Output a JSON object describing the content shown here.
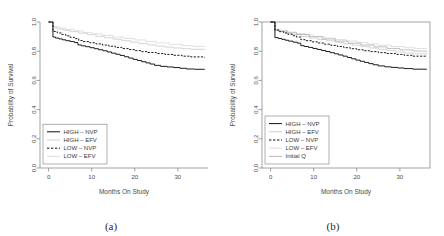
{
  "figure": {
    "panels": [
      {
        "id": "a",
        "caption": "(a)",
        "frame": "L-shaped",
        "legend": [
          {
            "label": "HIGH – NVP",
            "style": "solid",
            "color": "#111111"
          },
          {
            "label": "HIGH – EFV",
            "style": "solid",
            "color": "#c9c9c9"
          },
          {
            "label": "LOW – NVP",
            "style": "dashed",
            "color": "#111111"
          },
          {
            "label": "LOW – EFV",
            "style": "solid",
            "color": "#d8d8d8"
          }
        ]
      },
      {
        "id": "b",
        "caption": "(b)",
        "frame": "box",
        "legend": [
          {
            "label": "HIGH – NVP",
            "style": "solid",
            "color": "#111111"
          },
          {
            "label": "HIGH – EFV",
            "style": "solid",
            "color": "#c9c9c9"
          },
          {
            "label": "LOW – NVP",
            "style": "dashed",
            "color": "#111111"
          },
          {
            "label": "LOW – EFV",
            "style": "solid",
            "color": "#d8d8d8"
          },
          {
            "label": "Initial Q",
            "style": "solid",
            "color": "#b0b0b0"
          }
        ]
      }
    ]
  },
  "chart_data": [
    {
      "type": "line",
      "title": "",
      "panel": "(a)",
      "xlabel": "Months On Study",
      "ylabel": "Probability of Survival",
      "xlim": [
        -2,
        37
      ],
      "ylim": [
        0.0,
        1.0
      ],
      "xticks": [
        0,
        10,
        20,
        30
      ],
      "xticklabels": [
        "0",
        "10",
        "20",
        "30"
      ],
      "yticks": [
        0.0,
        0.2,
        0.4,
        0.6,
        0.8,
        1.0
      ],
      "yticklabels": [
        "0.0",
        "0.2",
        "0.4",
        "0.6",
        "0.8",
        "1.0"
      ],
      "grid": false,
      "legend_position": "lower-left",
      "step": "post",
      "series": [
        {
          "name": "HIGH – NVP",
          "style": "solid",
          "color": "#111111",
          "x": [
            0,
            1.0,
            1.6,
            2.4,
            3.2,
            4.0,
            5.0,
            6.0,
            6.8,
            7.6,
            8.6,
            9.6,
            10.6,
            11.6,
            12.6,
            13.6,
            14.6,
            15.6,
            16.6,
            17.6,
            18.6,
            19.6,
            20.6,
            21.6,
            22.6,
            23.6,
            24.6,
            26.0,
            27.5,
            29.0,
            30.5,
            32.0,
            34.0,
            36.2
          ],
          "y": [
            1.0,
            0.897,
            0.89,
            0.884,
            0.878,
            0.872,
            0.866,
            0.859,
            0.843,
            0.837,
            0.831,
            0.824,
            0.817,
            0.81,
            0.803,
            0.795,
            0.787,
            0.779,
            0.771,
            0.762,
            0.753,
            0.744,
            0.736,
            0.728,
            0.72,
            0.712,
            0.703,
            0.696,
            0.692,
            0.688,
            0.683,
            0.678,
            0.676,
            0.674
          ]
        },
        {
          "name": "HIGH – EFV",
          "style": "solid",
          "color": "#c9c9c9",
          "x": [
            0,
            1.0,
            2.0,
            3.5,
            5.0,
            7.0,
            9.0,
            11.0,
            13.0,
            15.0,
            17.0,
            19.0,
            21.0,
            23.0,
            25.0,
            27.0,
            29.0,
            31.0,
            33.0,
            36.2
          ],
          "y": [
            1.0,
            0.962,
            0.952,
            0.943,
            0.934,
            0.924,
            0.913,
            0.902,
            0.892,
            0.882,
            0.872,
            0.862,
            0.852,
            0.843,
            0.835,
            0.828,
            0.822,
            0.817,
            0.813,
            0.81
          ]
        },
        {
          "name": "LOW – NVP",
          "style": "dashed",
          "color": "#111111",
          "x": [
            0,
            1.0,
            2.0,
            3.0,
            4.0,
            5.0,
            6.0,
            7.0,
            8.0,
            9.5,
            11.0,
            12.5,
            14.0,
            15.5,
            17.0,
            18.5,
            20.0,
            21.5,
            23.0,
            25.0,
            27.0,
            29.0,
            31.0,
            33.0,
            36.2
          ],
          "y": [
            1.0,
            0.935,
            0.925,
            0.915,
            0.905,
            0.895,
            0.886,
            0.873,
            0.866,
            0.858,
            0.85,
            0.842,
            0.834,
            0.826,
            0.818,
            0.811,
            0.804,
            0.797,
            0.791,
            0.784,
            0.778,
            0.772,
            0.766,
            0.761,
            0.757
          ]
        },
        {
          "name": "LOW – EFV",
          "style": "solid",
          "color": "#d8d8d8",
          "x": [
            0,
            1.2,
            2.5,
            4.0,
            6.0,
            8.0,
            10.0,
            12.5,
            15.0,
            17.5,
            20.0,
            22.5,
            25.0,
            28.0,
            31.0,
            33.5,
            36.2
          ],
          "y": [
            1.0,
            0.968,
            0.958,
            0.949,
            0.939,
            0.929,
            0.919,
            0.908,
            0.897,
            0.887,
            0.877,
            0.867,
            0.857,
            0.847,
            0.838,
            0.832,
            0.828
          ]
        }
      ]
    },
    {
      "type": "line",
      "title": "",
      "panel": "(b)",
      "xlabel": "Months On Study",
      "ylabel": "Probability of Survival",
      "xlim": [
        -2,
        37
      ],
      "ylim": [
        0.0,
        1.0
      ],
      "xticks": [
        0,
        10,
        20,
        30
      ],
      "xticklabels": [
        "0",
        "10",
        "20",
        "30"
      ],
      "yticks": [
        0.0,
        0.2,
        0.4,
        0.6,
        0.8,
        1.0
      ],
      "yticklabels": [
        "0.0",
        "0.2",
        "0.4",
        "0.6",
        "0.8",
        "1.0"
      ],
      "grid": false,
      "legend_position": "lower-left",
      "step": "post",
      "series": [
        {
          "name": "HIGH – NVP",
          "style": "solid",
          "color": "#111111",
          "x": [
            0,
            1.0,
            1.8,
            2.6,
            3.4,
            4.2,
            5.2,
            6.2,
            7.0,
            7.8,
            8.8,
            9.8,
            10.8,
            11.8,
            12.8,
            13.8,
            14.8,
            15.8,
            16.8,
            17.8,
            18.8,
            19.8,
            20.8,
            21.8,
            22.8,
            23.8,
            25.0,
            26.5,
            28.0,
            29.5,
            31.0,
            33.0,
            36.2
          ],
          "y": [
            1.0,
            0.893,
            0.887,
            0.881,
            0.875,
            0.869,
            0.862,
            0.855,
            0.838,
            0.832,
            0.826,
            0.819,
            0.812,
            0.805,
            0.798,
            0.79,
            0.782,
            0.774,
            0.766,
            0.757,
            0.748,
            0.739,
            0.731,
            0.723,
            0.715,
            0.707,
            0.699,
            0.693,
            0.689,
            0.685,
            0.681,
            0.677,
            0.674
          ]
        },
        {
          "name": "HIGH – EFV",
          "style": "solid",
          "color": "#c9c9c9",
          "x": [
            0,
            1.0,
            2.0,
            3.5,
            5.0,
            7.0,
            9.0,
            11.0,
            13.0,
            15.0,
            17.0,
            19.0,
            21.0,
            23.0,
            25.0,
            27.0,
            29.0,
            31.0,
            33.0,
            36.2
          ],
          "y": [
            1.0,
            0.944,
            0.934,
            0.924,
            0.915,
            0.901,
            0.89,
            0.88,
            0.871,
            0.861,
            0.851,
            0.841,
            0.831,
            0.822,
            0.813,
            0.804,
            0.795,
            0.788,
            0.782,
            0.777
          ]
        },
        {
          "name": "LOW – NVP",
          "style": "dashed",
          "color": "#111111",
          "x": [
            0,
            1.0,
            2.0,
            3.0,
            4.0,
            5.0,
            6.0,
            7.0,
            8.0,
            9.5,
            11.0,
            12.5,
            14.0,
            15.5,
            17.0,
            18.5,
            20.0,
            21.5,
            23.0,
            25.0,
            27.0,
            29.0,
            31.0,
            33.0,
            36.2
          ],
          "y": [
            1.0,
            0.944,
            0.934,
            0.925,
            0.916,
            0.906,
            0.897,
            0.879,
            0.872,
            0.864,
            0.856,
            0.848,
            0.84,
            0.832,
            0.824,
            0.817,
            0.81,
            0.803,
            0.797,
            0.79,
            0.784,
            0.778,
            0.772,
            0.766,
            0.762
          ]
        },
        {
          "name": "LOW – EFV",
          "style": "solid",
          "color": "#d8d8d8",
          "x": [
            0,
            1.2,
            2.5,
            4.0,
            6.0,
            8.0,
            10.0,
            12.5,
            15.0,
            17.5,
            20.0,
            22.5,
            25.0,
            28.0,
            31.0,
            33.5,
            36.2
          ],
          "y": [
            1.0,
            0.95,
            0.94,
            0.931,
            0.921,
            0.911,
            0.901,
            0.89,
            0.88,
            0.87,
            0.86,
            0.85,
            0.841,
            0.832,
            0.824,
            0.818,
            0.814
          ]
        },
        {
          "name": "Initial Q",
          "style": "solid",
          "color": "#b0b0b0",
          "x": [
            0,
            1.0,
            2.0,
            4.0,
            6.0,
            9.0,
            12.0,
            15.0,
            18.0,
            21.0,
            24.0,
            27.0,
            30.0,
            33.0,
            36.2
          ],
          "y": [
            1.0,
            0.948,
            0.938,
            0.926,
            0.915,
            0.899,
            0.884,
            0.869,
            0.855,
            0.842,
            0.83,
            0.819,
            0.809,
            0.801,
            0.796
          ]
        }
      ]
    }
  ]
}
